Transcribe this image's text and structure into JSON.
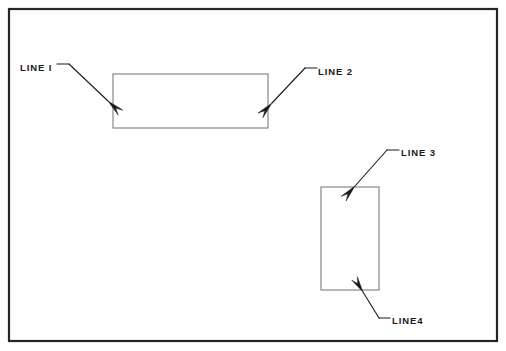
{
  "figure": {
    "name": "line-callout-diagram",
    "background_color": "#ffffff",
    "frame": {
      "name": "drawing-border",
      "x": 9,
      "y": 9,
      "width": 488,
      "height": 332,
      "stroke_color": "#262626",
      "stroke_width": 2.2
    },
    "shapes": [
      {
        "name": "horizontal-rectangle",
        "x": 113,
        "y": 74,
        "width": 155,
        "height": 54,
        "stroke_color": "#7d7d7d",
        "stroke_width": 1.1,
        "fill": "#ffffff"
      },
      {
        "name": "vertical-rectangle",
        "x": 321,
        "y": 187,
        "width": 58,
        "height": 103,
        "stroke_color": "#7d7d7d",
        "stroke_width": 1.1,
        "fill": "#ffffff"
      }
    ],
    "callouts": [
      {
        "id": "line-1",
        "label": "LINE I",
        "label_x": 20,
        "label_y": 71,
        "leader_color": "#1a1a1a",
        "leader_width": 1.1,
        "shelf": {
          "x1": 57,
          "y1": 64,
          "x2": 69,
          "y2": 64
        },
        "leader": {
          "x1": 69,
          "y1": 64,
          "x2": 108,
          "y2": 101
        },
        "arrow_tip": {
          "x": 108,
          "y": 101
        },
        "arrow_angle_deg": 43,
        "arrow_length": 17,
        "arrow_half_width": 3.4,
        "target": "horizontal-rectangle"
      },
      {
        "id": "line-2",
        "label": "LINE 2",
        "label_x": 318,
        "label_y": 75,
        "leader_color": "#1a1a1a",
        "leader_width": 1.1,
        "shelf": {
          "x1": 317,
          "y1": 68,
          "x2": 305,
          "y2": 68
        },
        "leader": {
          "x1": 305,
          "y1": 68,
          "x2": 272,
          "y2": 103
        },
        "arrow_tip": {
          "x": 272,
          "y": 103
        },
        "arrow_angle_deg": 133,
        "arrow_length": 17,
        "arrow_half_width": 3.4,
        "target": "horizontal-rectangle"
      },
      {
        "id": "line-3",
        "label": "LINE 3",
        "label_x": 401,
        "label_y": 156,
        "leader_color": "#1a1a1a",
        "leader_width": 1.1,
        "shelf": {
          "x1": 399,
          "y1": 150,
          "x2": 387,
          "y2": 150
        },
        "leader": {
          "x1": 387,
          "y1": 150,
          "x2": 355,
          "y2": 186
        },
        "arrow_tip": {
          "x": 355,
          "y": 186
        },
        "arrow_angle_deg": 132,
        "arrow_length": 17,
        "arrow_half_width": 3.4,
        "target": "vertical-rectangle"
      },
      {
        "id": "line-4",
        "label": "LINE4",
        "label_x": 392,
        "label_y": 324,
        "leader_color": "#1a1a1a",
        "leader_width": 1.1,
        "shelf": {
          "x1": 390,
          "y1": 318,
          "x2": 379,
          "y2": 318
        },
        "leader": {
          "x1": 379,
          "y1": 318,
          "x2": 363,
          "y2": 292
        },
        "arrow_tip": {
          "x": 363,
          "y": 292
        },
        "arrow_angle_deg": 238,
        "arrow_length": 16,
        "arrow_half_width": 3.3,
        "target": "vertical-rectangle"
      }
    ]
  }
}
